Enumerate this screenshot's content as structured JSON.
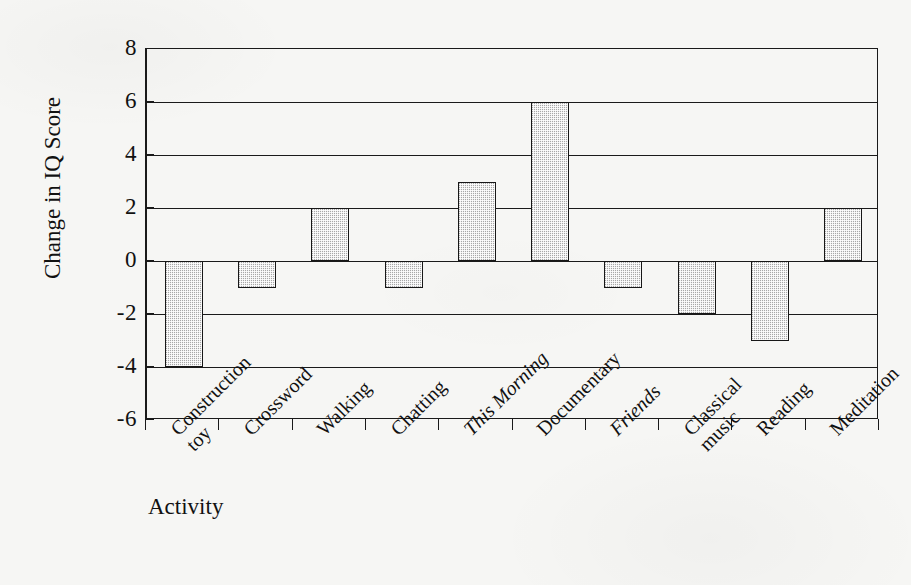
{
  "figure": {
    "background_color": "#f6f6f4",
    "ink_color": "#1a1a1a",
    "bar_fill_color": "#a8a8a8",
    "bar_edge_color": "#171717"
  },
  "axes": {
    "y_axis_title": "Change in IQ Score",
    "x_axis_title": "Activity",
    "y_ticks": [
      "8",
      "6",
      "4",
      "2",
      "0",
      "-2",
      "-4",
      "-6"
    ]
  },
  "chart_data": {
    "type": "bar",
    "title": "",
    "subtitle": "",
    "xlabel": "Activity",
    "ylabel": "Change in IQ Score",
    "ylim": [
      -6,
      8
    ],
    "ytick_values": [
      8,
      6,
      4,
      2,
      0,
      -2,
      -4,
      -6
    ],
    "grid": true,
    "grid_axis": "y",
    "legend": false,
    "legend_position": "none",
    "orientation": "vertical",
    "categories": [
      "Construction toy",
      "Crossword",
      "Walking",
      "Chatting",
      "This Morning",
      "Documentary",
      "Friends",
      "Classical music",
      "Reading",
      "Meditation"
    ],
    "values": [
      -4,
      -1,
      2,
      -1,
      3,
      6,
      -1,
      -2,
      -3,
      2
    ],
    "category_label_lines": [
      [
        "Construction",
        "toy"
      ],
      [
        "Crossword"
      ],
      [
        "Walking"
      ],
      [
        "Chatting"
      ],
      [
        "This Morning"
      ],
      [
        "Documentary"
      ],
      [
        "Friends"
      ],
      [
        "Classical",
        "music"
      ],
      [
        "Reading"
      ],
      [
        "Meditation"
      ]
    ],
    "category_label_italic": [
      false,
      false,
      false,
      false,
      true,
      false,
      true,
      false,
      false,
      false
    ],
    "annotations": []
  }
}
